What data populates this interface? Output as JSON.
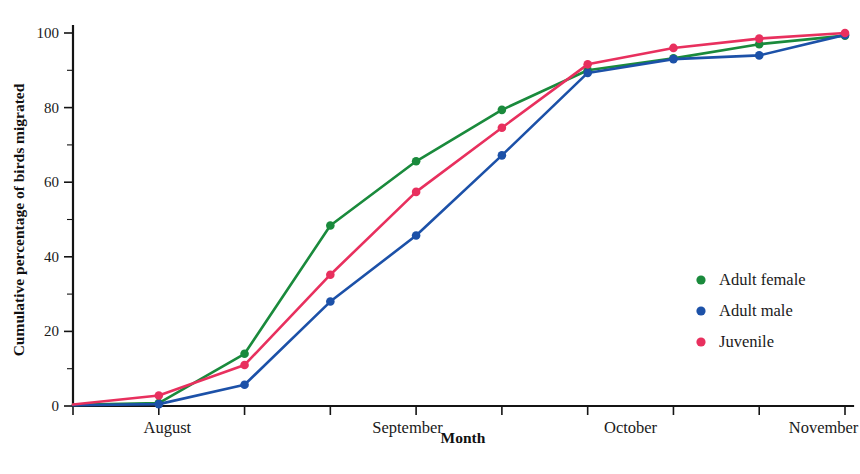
{
  "chart_data": {
    "type": "line",
    "title": "",
    "xlabel": "Month",
    "ylabel": "Cumulative percentage of birds migrated",
    "ylim": [
      0,
      100
    ],
    "xlim": [
      0,
      10
    ],
    "grid": false,
    "legend_position": "right-middle",
    "x": [
      0,
      1,
      2,
      3,
      4,
      5,
      6,
      7,
      8,
      9
    ],
    "x_tick_values": [
      0,
      1,
      2,
      3,
      4,
      5,
      6,
      7,
      8,
      9
    ],
    "y_ticks_major": [
      0,
      20,
      40,
      60,
      80,
      100
    ],
    "y_ticks_minor": [
      10,
      30,
      50,
      70,
      90
    ],
    "x_category_labels": [
      "August",
      "September",
      "October",
      "November"
    ],
    "x_category_positions": [
      1.1,
      3.9,
      6.5,
      8.75
    ],
    "series": [
      {
        "name": "Adult female",
        "color": "#1a8a3c",
        "values": [
          0.3,
          0.8,
          14.0,
          48.4,
          65.6,
          79.4,
          90.0,
          93.2,
          97.0,
          99.3
        ]
      },
      {
        "name": "Adult male",
        "color": "#1c51a8",
        "values": [
          0.2,
          0.5,
          5.7,
          28.0,
          45.7,
          67.2,
          89.3,
          93.0,
          94.0,
          99.5
        ]
      },
      {
        "name": "Juvenile",
        "color": "#e8305e",
        "values": [
          0.4,
          2.8,
          11.0,
          35.2,
          57.4,
          74.6,
          91.6,
          96.0,
          98.5,
          100.0
        ]
      }
    ]
  },
  "legend": {
    "entries": [
      {
        "label": "Adult female",
        "color": "#1a8a3c",
        "marker": "legend-dot-adult-female"
      },
      {
        "label": "Adult male",
        "color": "#1c51a8",
        "marker": "legend-dot-adult-male"
      },
      {
        "label": "Juvenile",
        "color": "#e8305e",
        "marker": "legend-dot-juvenile"
      }
    ]
  },
  "axes": {
    "y_title": "Cumulative percentage of birds migrated",
    "x_title": "Month",
    "y_tick_labels": [
      "0",
      "20",
      "40",
      "60",
      "80",
      "100"
    ],
    "x_tick_labels": [
      "August",
      "September",
      "October",
      "November"
    ]
  },
  "colors": {
    "adult_female": "#1a8a3c",
    "adult_male": "#1c51a8",
    "juvenile": "#e8305e",
    "axis": "#141414",
    "background": "#ffffff",
    "text": "#1a1a1a"
  }
}
